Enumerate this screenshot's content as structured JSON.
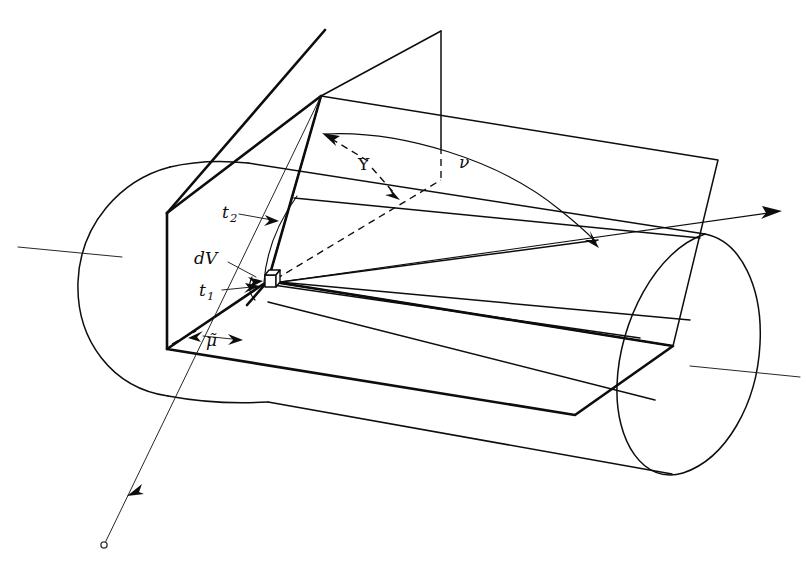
{
  "figure": {
    "background_color": "#ffffff",
    "line_color": "#0d0d0d",
    "width": 806,
    "height": 569
  },
  "labels": {
    "dv": "dV",
    "t1_base": "t",
    "t1_sub": "1",
    "t2_base": "t",
    "t2_sub": "2",
    "upsilon": "Υ",
    "nu": "ν",
    "mu_tilde": "μ̃"
  },
  "elements": {
    "cylinder_name": "cylinder-body",
    "left_cap_name": "cylinder-left-cap",
    "right_cap_name": "cylinder-right-cap",
    "axis_name": "cylinder-axis-line",
    "cut_plane_name": "vertical-cut-plane",
    "top_plane_name": "upper-slanted-plane",
    "bottom_plane_name": "lower-slanted-plane",
    "flag_name": "triangular-flag",
    "ray_in_name": "incoming-ray",
    "ray_out_name": "outgoing-ray",
    "dv_marker_name": "dv-volume-element-cube",
    "arc_upsilon_name": "upsilon-angle-arc",
    "arc_nu_name": "nu-angle-arc",
    "arc_t2_name": "t2-arc",
    "arc_mu_name": "mu-tilde-arc"
  }
}
